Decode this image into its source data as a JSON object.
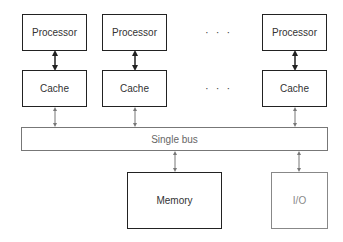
{
  "diagram": {
    "type": "shared-bus multiprocessor architecture",
    "processors": [
      {
        "label": "Processor"
      },
      {
        "label": "Processor"
      },
      {
        "label": "Processor"
      }
    ],
    "caches": [
      {
        "label": "Cache"
      },
      {
        "label": "Cache"
      },
      {
        "label": "Cache"
      }
    ],
    "ellipsis": "· · ·",
    "bus": {
      "label": "Single bus"
    },
    "memory": {
      "label": "Memory"
    },
    "io": {
      "label": "I/O"
    },
    "colors": {
      "primary_stroke": "#222222",
      "secondary_stroke": "#888888",
      "background": "#ffffff"
    }
  }
}
